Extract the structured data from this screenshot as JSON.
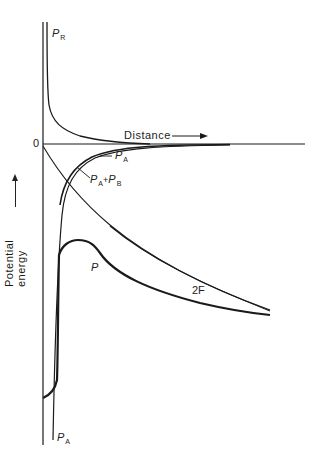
{
  "diagram": {
    "axes": {
      "x_label": "Distance",
      "y_label": "Potential energy",
      "origin_label": "0"
    },
    "curves": [
      {
        "id": "PR",
        "label_main": "P",
        "label_sub": "R",
        "description": "repulsive potential, rises steeply near origin"
      },
      {
        "id": "PA",
        "label_main": "P",
        "label_sub": "A",
        "description": "attractive potential, plunges steeply near origin"
      },
      {
        "id": "PA_PB",
        "label_main": "P",
        "label_sub": "A",
        "label_plus": "+",
        "label_main2": "P",
        "label_sub2": "B",
        "description": "combined attractive + B potential"
      },
      {
        "id": "P",
        "label_main": "P",
        "description": "total potential with maximum"
      },
      {
        "id": "2F",
        "label_main": "2F",
        "description": "double-line curve"
      }
    ],
    "colors": {
      "line": "#1a1a1a",
      "background": "#ffffff"
    }
  }
}
